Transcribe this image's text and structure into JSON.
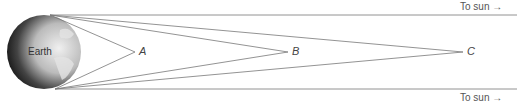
{
  "diagram": {
    "earth_label": "Earth",
    "sun_label_top": "To sun →",
    "sun_label_bottom": "To sun →",
    "points": [
      {
        "label": "A",
        "x": 135
      },
      {
        "label": "B",
        "x": 288
      },
      {
        "label": "C",
        "x": 463
      }
    ]
  }
}
